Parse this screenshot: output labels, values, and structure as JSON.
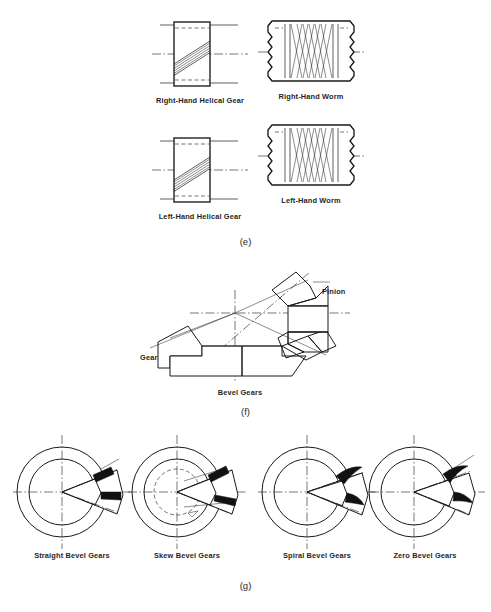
{
  "document": {
    "type": "technical-illustration",
    "subject": "Gear types reference plate",
    "background_color": "#ffffff",
    "line_color": "#1a1a1a"
  },
  "panels": [
    {
      "id": "e",
      "figure_label": "(e)",
      "title": "Helical gears and worms",
      "items": [
        {
          "key": "right_hand_helical_gear",
          "caption": "Right-Hand Helical Gear",
          "icon": "helical-gear-right-icon"
        },
        {
          "key": "right_hand_worm",
          "caption": "Right-Hand Worm",
          "icon": "worm-right-icon"
        },
        {
          "key": "left_hand_helical_gear",
          "caption": "Left-Hand Helical Gear",
          "icon": "helical-gear-left-icon"
        },
        {
          "key": "left_hand_worm",
          "caption": "Left-Hand Worm",
          "icon": "worm-left-icon"
        }
      ]
    },
    {
      "id": "f",
      "figure_label": "(f)",
      "title": "Bevel gear pair cross-section",
      "items": [
        {
          "key": "gear",
          "caption": "Gear",
          "icon": "bevel-gear-icon"
        },
        {
          "key": "pinion",
          "caption": "Pinion",
          "icon": "bevel-pinion-icon"
        },
        {
          "key": "bevel_gears",
          "caption": "Bevel Gears",
          "icon": "bevel-gear-assembly-icon"
        }
      ]
    },
    {
      "id": "g",
      "figure_label": "(g)",
      "title": "Bevel gear tooth forms",
      "items": [
        {
          "key": "straight_bevel_gears",
          "caption": "Straight Bevel Gears",
          "icon": "straight-bevel-gear-icon"
        },
        {
          "key": "skew_bevel_gears",
          "caption": "Skew Bevel Gears",
          "icon": "skew-bevel-gear-icon"
        },
        {
          "key": "spiral_bevel_gears",
          "caption": "Spiral Bevel Gears",
          "icon": "spiral-bevel-gear-icon"
        },
        {
          "key": "zero_bevel_gears",
          "caption": "Zero Bevel Gears",
          "icon": "zero-bevel-gear-icon"
        }
      ]
    }
  ]
}
